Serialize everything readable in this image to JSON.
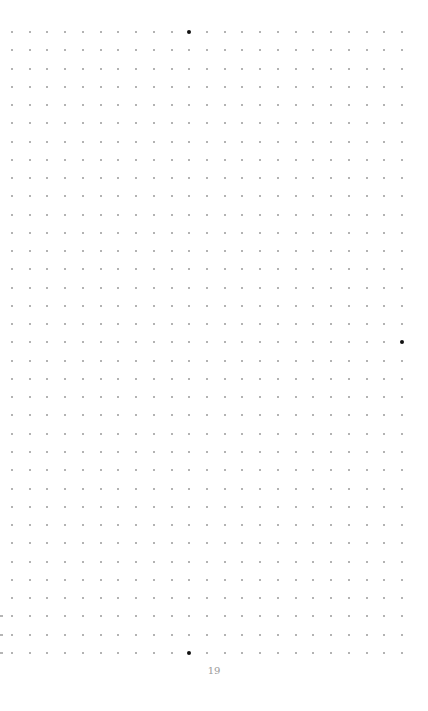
{
  "page": {
    "type": "dot-grid-notebook-page",
    "page_number": "19",
    "background": "#ffffff",
    "dot_color": "#9a9a9a",
    "highlight_dot_color": "#111111"
  },
  "grid": {
    "columns": 23,
    "rows": 35,
    "origin_x": 12,
    "origin_y": 32,
    "step_x": 17.73,
    "step_y": 18.26,
    "highlighted_dots": [
      {
        "col": 10,
        "row": 0
      },
      {
        "col": 22,
        "row": 17
      },
      {
        "col": 10,
        "row": 34
      }
    ],
    "margin_marks_rows": [
      32,
      33,
      34
    ]
  }
}
